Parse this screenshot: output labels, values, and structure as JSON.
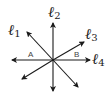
{
  "diagram": {
    "lines": [
      {
        "label_main": "ℓ",
        "label_sub": "1"
      },
      {
        "label_main": "ℓ",
        "label_sub": "2"
      },
      {
        "label_main": "ℓ",
        "label_sub": "3"
      },
      {
        "label_main": "ℓ",
        "label_sub": "4"
      }
    ],
    "angles": [
      {
        "label": "A"
      },
      {
        "label": "B"
      }
    ],
    "colors": {
      "line": "#1a1a1a",
      "angle_label": "#444444"
    }
  }
}
